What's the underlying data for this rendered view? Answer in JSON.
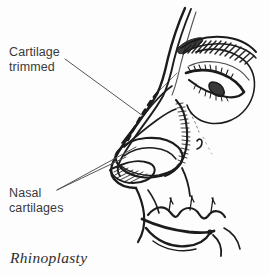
{
  "figure": {
    "kind": "medical-line-illustration",
    "caption": "Rhinoplasty",
    "background_color": "#fdfdfd",
    "ink_color": "#1c1c1c",
    "label_color": "#3a3a3a",
    "leader_line_color": "#555555"
  },
  "labels": [
    {
      "id": "cartilage-trimmed",
      "line1": "Cartilage",
      "line2": "trimmed",
      "leader": "points down-right to the dashed resection line along the nasal dorsum"
    },
    {
      "id": "nasal-cartilages",
      "line1": "Nasal",
      "line2": "cartilages",
      "leader": "two lines point up-right to the lower lateral and upper lateral cartilages"
    }
  ],
  "annotations": {
    "dashed_line_name": "cartilage-resection-dashed-line",
    "hatching_name": "cartilage-hatching",
    "profile_name": "face-profile-outline",
    "eye_name": "eye",
    "eyebrow_name": "eyebrow",
    "lips_name": "lips",
    "nostril_name": "nostril"
  }
}
